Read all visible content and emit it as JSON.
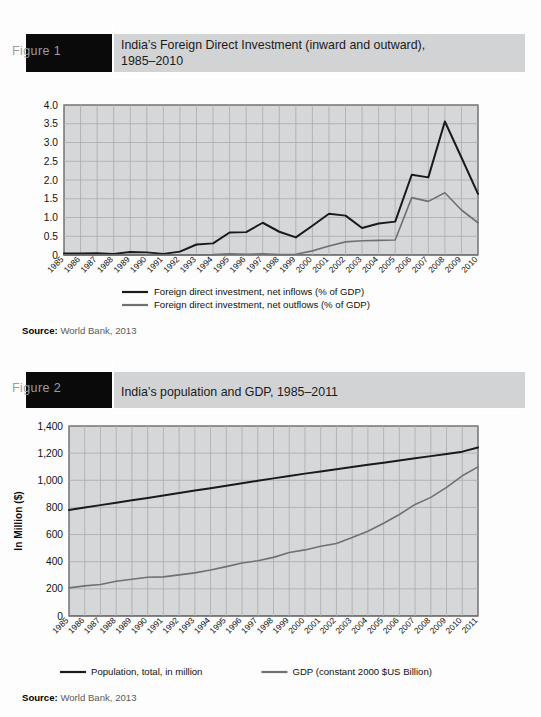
{
  "figures": [
    {
      "tab_label": "Figure 1",
      "title": "India’s Foreign Direct Investment (inward and outward),\n1985–2010",
      "source_label": "Source:",
      "source_value": "World Bank, 2013"
    },
    {
      "tab_label": "Figure 2",
      "title": "India’s population and GDP, 1985–2011",
      "source_label": "Source:",
      "source_value": "World Bank, 2013"
    }
  ],
  "colors": {
    "tab_background": "#0a0a0a",
    "band_background": "#d2d3d5",
    "plot_background": "#d6d7d9",
    "grid": "#a9abae",
    "series_dark": "#1a1a1a",
    "series_gray": "#6f7174",
    "axis": "#3a3a3a",
    "rule_white": "#ffffff"
  },
  "chart_data": [
    {
      "type": "line",
      "title": "India’s Foreign Direct Investment (inward and outward), 1985–2010",
      "xlabel": "",
      "ylabel": "",
      "categories": [
        "1985",
        "1986",
        "1987",
        "1988",
        "1989",
        "1990",
        "1991",
        "1992",
        "1993",
        "1994",
        "1995",
        "1996",
        "1997",
        "1998",
        "1999",
        "2000",
        "2001",
        "2002",
        "2003",
        "2004",
        "2005",
        "2006",
        "2007",
        "2008",
        "2009",
        "2010"
      ],
      "yticks": [
        "0",
        "0.5",
        "1.0",
        "1.5",
        "2.0",
        "2.5",
        "3.0",
        "3.5",
        "4.0"
      ],
      "ylim": [
        0,
        4.0
      ],
      "grid": true,
      "legend_position": "bottom",
      "series": [
        {
          "name": "Foreign direct investment, net inflows (% of GDP)",
          "color": "#1a1a1a",
          "values": [
            0.04,
            0.04,
            0.05,
            0.03,
            0.08,
            0.07,
            0.03,
            0.09,
            0.28,
            0.31,
            0.6,
            0.61,
            0.86,
            0.62,
            0.47,
            0.78,
            1.1,
            1.05,
            0.72,
            0.84,
            0.89,
            2.14,
            2.07,
            3.56,
            2.6,
            1.63
          ]
        },
        {
          "name": "Foreign direct investment, net outflows (% of GDP)",
          "color": "#6f7174",
          "values": [
            0.0,
            0.0,
            0.0,
            0.0,
            0.0,
            0.0,
            0.0,
            0.0,
            0.0,
            0.01,
            0.03,
            0.02,
            0.03,
            0.01,
            0.02,
            0.11,
            0.24,
            0.35,
            0.38,
            0.39,
            0.4,
            1.53,
            1.43,
            1.66,
            1.2,
            0.86
          ]
        }
      ]
    },
    {
      "type": "line",
      "title": "India’s population and GDP, 1985–2011",
      "xlabel": "",
      "ylabel": "In Million ($)",
      "categories": [
        "1985",
        "1986",
        "1987",
        "1988",
        "1989",
        "1990",
        "1991",
        "1992",
        "1993",
        "1994",
        "1995",
        "1996",
        "1997",
        "1998",
        "1999",
        "2000",
        "2001",
        "2002",
        "2003",
        "2004",
        "2005",
        "2006",
        "2007",
        "2008",
        "2009",
        "2010",
        "2011"
      ],
      "yticks": [
        "0",
        "200",
        "400",
        "600",
        "800",
        "1,000",
        "1,200",
        "1,400"
      ],
      "ylim": [
        0,
        1400
      ],
      "grid": true,
      "legend_position": "bottom",
      "series": [
        {
          "name": "Population, total, in million",
          "color": "#1a1a1a",
          "values": [
            781,
            799,
            817,
            835,
            853,
            870,
            888,
            906,
            924,
            942,
            960,
            978,
            996,
            1014,
            1031,
            1049,
            1065,
            1082,
            1098,
            1114,
            1130,
            1146,
            1162,
            1178,
            1194,
            1211,
            1241
          ]
        },
        {
          "name": "GDP (constant 2000 $US Billion)",
          "color": "#6f7174",
          "values": [
            207,
            222,
            232,
            256,
            271,
            286,
            288,
            303,
            318,
            339,
            364,
            391,
            407,
            432,
            468,
            487,
            514,
            534,
            578,
            625,
            683,
            748,
            822,
            874,
            948,
            1033,
            1099
          ]
        }
      ]
    }
  ]
}
